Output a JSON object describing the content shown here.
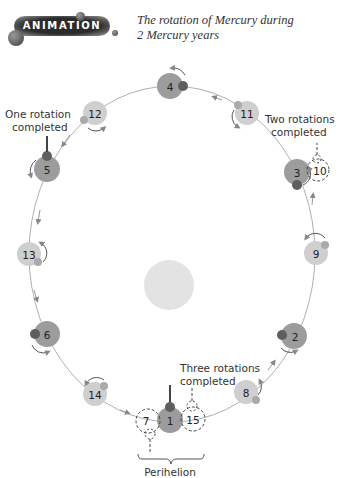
{
  "header": {
    "badge_label": "ANIMATION",
    "title_line1": "The rotation of Mercury during",
    "title_line2": "2 Mercury years"
  },
  "annotations": {
    "one_rotation": [
      "One rotation",
      "completed"
    ],
    "two_rotations": [
      "Two rotations",
      "completed"
    ],
    "three_rotations": [
      "Three rotations",
      "completed"
    ],
    "perihelion": "Perihelion"
  },
  "colors": {
    "orbit": "#a8a8a8",
    "year1_planet": "#9c9c9c",
    "year2_planet": "#cfcfcf",
    "marker": "#5e5e5e",
    "sun": "#e2e2e2",
    "text": "#333333"
  },
  "planets": [
    {
      "n": "1",
      "x": 170,
      "y": 420,
      "year": 1
    },
    {
      "n": "2",
      "x": 294,
      "y": 336,
      "year": 1
    },
    {
      "n": "3",
      "x": 297,
      "y": 172,
      "year": 1
    },
    {
      "n": "4",
      "x": 170,
      "y": 86,
      "year": 1
    },
    {
      "n": "5",
      "x": 47,
      "y": 169,
      "year": 1
    },
    {
      "n": "6",
      "x": 47,
      "y": 334,
      "year": 1
    },
    {
      "n": "8",
      "x": 246,
      "y": 392,
      "year": 2
    },
    {
      "n": "9",
      "x": 316,
      "y": 253,
      "year": 2
    },
    {
      "n": "11",
      "x": 247,
      "y": 113,
      "year": 2
    },
    {
      "n": "12",
      "x": 95,
      "y": 113,
      "year": 2
    },
    {
      "n": "13",
      "x": 29,
      "y": 254,
      "year": 2
    },
    {
      "n": "14",
      "x": 95,
      "y": 394,
      "year": 2
    }
  ],
  "ghost_planets": [
    {
      "n": "7",
      "x": 146,
      "y": 421
    },
    {
      "n": "15",
      "x": 192,
      "y": 419
    },
    {
      "n": "10",
      "x": 318,
      "y": 170
    }
  ]
}
